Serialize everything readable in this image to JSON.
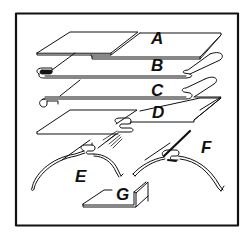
{
  "figure": {
    "colors": {
      "ink": "#111111",
      "paper": "#ffffff"
    },
    "labels": [
      {
        "id": "A",
        "text": "A",
        "x": 151,
        "y": 31
      },
      {
        "id": "B",
        "text": "B",
        "x": 151,
        "y": 57
      },
      {
        "id": "C",
        "text": "C",
        "x": 151,
        "y": 83
      },
      {
        "id": "D",
        "text": "D",
        "x": 152,
        "y": 104
      },
      {
        "id": "E",
        "text": "E",
        "x": 75,
        "y": 168
      },
      {
        "id": "F",
        "text": "F",
        "x": 201,
        "y": 140
      },
      {
        "id": "G",
        "text": "G",
        "x": 116,
        "y": 186
      }
    ]
  }
}
